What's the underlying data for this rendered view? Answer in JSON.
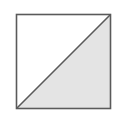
{
  "diagram": {
    "shape": "square-split-by-diagonal",
    "square": {
      "x": 16,
      "y": 14,
      "size": 94,
      "stroke": "#5a5a5a",
      "fill": "#ffffff"
    },
    "diagonal": {
      "from": "bottom-left",
      "to": "top-right"
    },
    "shaded_region": {
      "position": "lower-right triangle",
      "fill": "#e4e4e4"
    },
    "unshaded_region": {
      "position": "upper-left triangle",
      "fill": "#ffffff"
    }
  }
}
